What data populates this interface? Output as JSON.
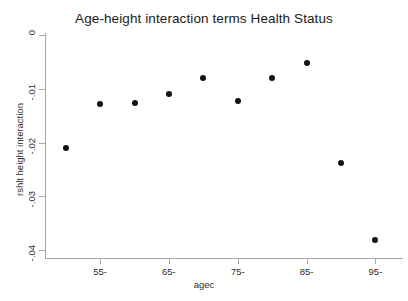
{
  "chart_data": {
    "type": "scatter",
    "title": "Age-height interaction terms Health Status",
    "xlabel": "agec",
    "ylabel": "rshlt height interaction",
    "x": [
      50,
      55,
      60,
      65,
      70,
      75,
      80,
      85,
      90,
      95
    ],
    "values": [
      -0.021,
      -0.0128,
      -0.0126,
      -0.011,
      -0.008,
      -0.0123,
      -0.008,
      -0.0052,
      -0.0238,
      -0.0381
    ],
    "categories": [
      "50-",
      "55-",
      "60-",
      "65-",
      "70-",
      "75-",
      "80-",
      "85-",
      "90-",
      "95-"
    ],
    "xtick_values": [
      55,
      65,
      75,
      85,
      95
    ],
    "xtick_labels": [
      "55-",
      "65-",
      "75-",
      "85-",
      "95-"
    ],
    "ytick_values": [
      0,
      -0.01,
      -0.02,
      -0.03,
      -0.04
    ],
    "ytick_labels": [
      "0",
      "-.01",
      "-.02",
      "-.03",
      "-.04"
    ],
    "xlim": [
      47,
      99
    ],
    "ylim": [
      -0.0415,
      0.0005
    ],
    "grid": false,
    "legend": null,
    "marker": "filled-circle",
    "marker_color": "#111111",
    "axis_color": "#a8a8a8",
    "background": "#ffffff"
  }
}
